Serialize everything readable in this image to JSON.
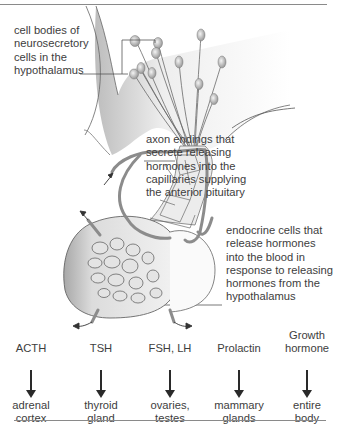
{
  "labels": {
    "cell_bodies": "cell bodies of\nneurosecretory\ncells in the\nhypothalamus",
    "axon_endings": "axon endings that\nsecrete releasing\nhormones into the\ncapillaries supplying\nthe anterior pituitary",
    "endocrine_cells": "endocrine cells that\nrelease hormones\ninto the blood in\nresponse to releasing\nhormones from the\nhypothalamus"
  },
  "hormones": [
    {
      "name": "ACTH",
      "target": "adrenal\ncortex"
    },
    {
      "name": "TSH",
      "target": "thyroid\ngland"
    },
    {
      "name": "FSH, LH",
      "target": "ovaries,\ntestes"
    },
    {
      "name": "Prolactin",
      "target": "mammary\nglands"
    },
    {
      "name": "Growth\nhormone",
      "target": "entire\nbody"
    }
  ],
  "colors": {
    "rule": "#8a8a8a",
    "text": "#3d3d3d",
    "tissue": "#d9d9d9",
    "vessel": "#9a9a9a"
  }
}
